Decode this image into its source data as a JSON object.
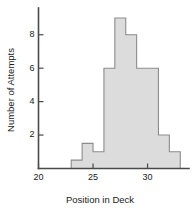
{
  "chart_data": {
    "type": "bar",
    "title": "",
    "subtitle": "",
    "xlabel": "Position in Deck",
    "ylabel": "Number of Attempts",
    "categories": [
      23,
      24,
      25,
      26,
      27,
      28,
      29,
      30,
      31,
      32
    ],
    "values": [
      0.5,
      1.5,
      1,
      6,
      9,
      8,
      6,
      6,
      2,
      1
    ],
    "bin_width": 1,
    "bin_edges": [
      23,
      24,
      25,
      26,
      27,
      28,
      29,
      30,
      31,
      32,
      33
    ],
    "series": [
      {
        "name": "Number of Attempts",
        "values": [
          0.5,
          1.5,
          1,
          6,
          9,
          8,
          6,
          6,
          2,
          1
        ]
      }
    ],
    "xlim": [
      20,
      33.8
    ],
    "ylim": [
      0,
      9.6
    ],
    "x_ticks": [
      20,
      25,
      30
    ],
    "x_tick_labels": [
      "20",
      "25",
      "30"
    ],
    "y_ticks": [
      2,
      4,
      6,
      8
    ],
    "y_tick_labels": [
      "2",
      "4",
      "6",
      "8"
    ],
    "grid": false,
    "legend": null,
    "legend_position": "none",
    "colors": {
      "bar_fill": "#dcdcdc",
      "bar_edge": "#8c8c8c",
      "axis": "#4a4a4a",
      "text": "#1a1a1a",
      "background": "#ffffff"
    }
  }
}
